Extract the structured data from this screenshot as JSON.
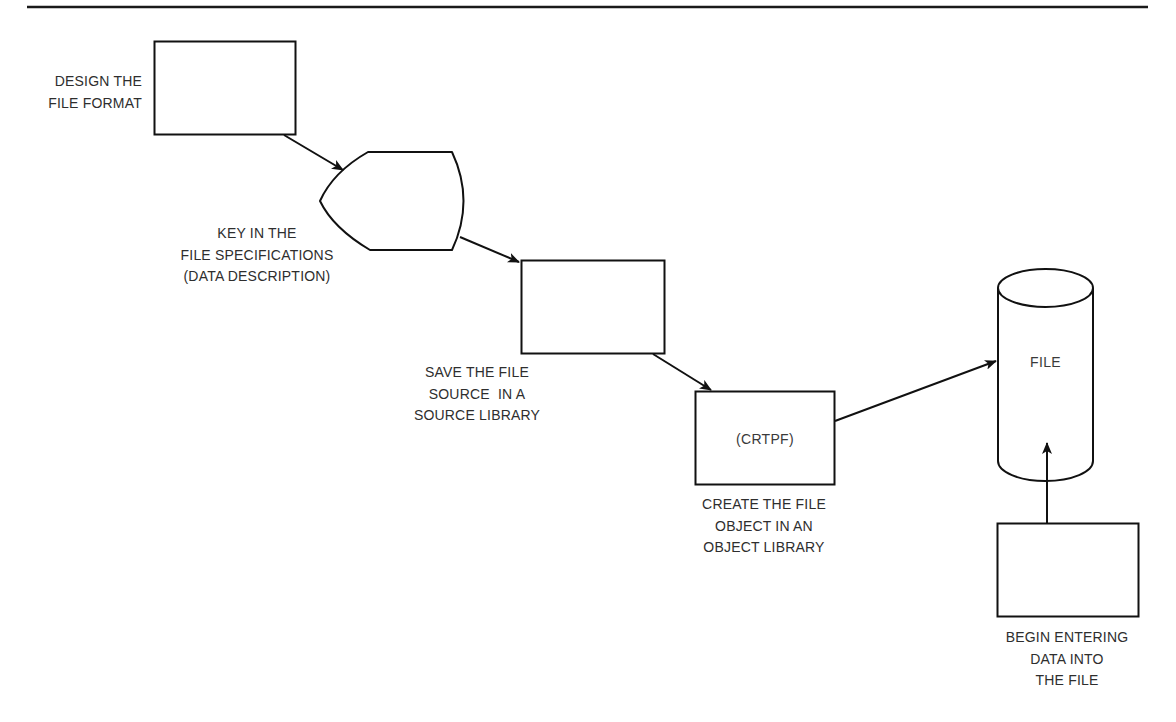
{
  "diagram": {
    "type": "flowchart",
    "colors": {
      "stroke": "#111111",
      "text": "#2e2e2e",
      "background": "#ffffff"
    },
    "nodes": [
      {
        "id": "design",
        "shape": "rectangle",
        "inner_text": "",
        "label_lines": [
          "DESIGN THE",
          "FILE FORMAT"
        ]
      },
      {
        "id": "key-in",
        "shape": "display",
        "inner_text": "",
        "label_lines": [
          "KEY IN THE",
          "FILE SPECIFICATIONS",
          "(DATA DESCRIPTION)"
        ]
      },
      {
        "id": "save-source",
        "shape": "rectangle",
        "inner_text": "",
        "label_lines": [
          "SAVE THE FILE",
          "SOURCE  IN A",
          "SOURCE LIBRARY"
        ]
      },
      {
        "id": "create-object",
        "shape": "rectangle",
        "inner_text": "(CRTPF)",
        "label_lines": [
          "CREATE THE FILE",
          "OBJECT IN AN",
          "OBJECT LIBRARY"
        ]
      },
      {
        "id": "file",
        "shape": "cylinder",
        "inner_text": "FILE",
        "label_lines": []
      },
      {
        "id": "enter-data",
        "shape": "rectangle",
        "inner_text": "",
        "label_lines": [
          "BEGIN ENTERING",
          "DATA INTO",
          "THE FILE"
        ]
      }
    ],
    "edges": [
      {
        "from": "design",
        "to": "key-in"
      },
      {
        "from": "key-in",
        "to": "save-source"
      },
      {
        "from": "save-source",
        "to": "create-object"
      },
      {
        "from": "create-object",
        "to": "file"
      },
      {
        "from": "enter-data",
        "to": "file"
      }
    ]
  }
}
